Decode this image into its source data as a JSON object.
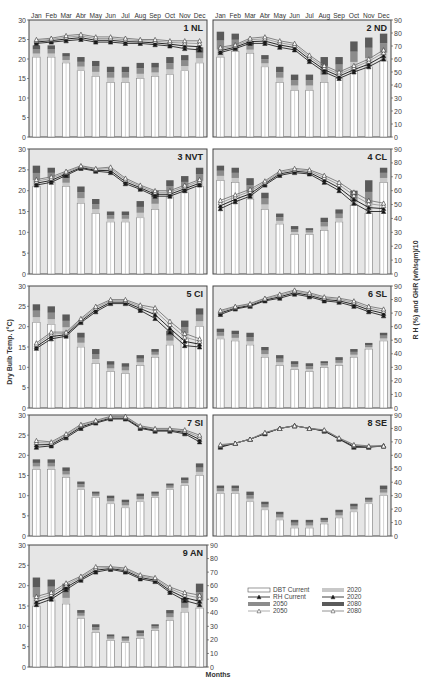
{
  "chart_data": {
    "type": "bar",
    "title": "",
    "xlabel": "Months",
    "ylabel": "Dry Bulb Temp. (°C)",
    "ylabel_right": "R H (%) and GHR (wh/sqm)/10",
    "ylim": [
      0,
      30
    ],
    "ylim_right": [
      0,
      90
    ],
    "left_ticks": [
      "0",
      "5",
      "10",
      "15",
      "20",
      "25",
      "30"
    ],
    "right_ticks": [
      "0",
      "10",
      "20",
      "30",
      "40",
      "50",
      "60",
      "70",
      "80",
      "90"
    ],
    "categories": [
      "Jan",
      "Feb",
      "Mar",
      "Abr",
      "May",
      "Jun",
      "Jul",
      "Aug",
      "Sep",
      "Oct",
      "Nov",
      "Dec"
    ],
    "legend": [
      {
        "key": "dbt_current",
        "label": "DBT Current"
      },
      {
        "key": "rh_current",
        "label": "RH Current"
      },
      {
        "key": "dbt_2050",
        "label": "2050"
      },
      {
        "key": "rh_2050",
        "label": "2050"
      },
      {
        "key": "dbt_2020",
        "label": "2020"
      },
      {
        "key": "rh_2020",
        "label": "2020"
      },
      {
        "key": "dbt_2080",
        "label": "2080"
      },
      {
        "key": "rh_2080",
        "label": "2080"
      }
    ],
    "grid": false,
    "legend_position": "bottom-right",
    "panels": [
      {
        "id": "1 NL",
        "label": "1 NL",
        "dbt_current": [
          20.5,
          20.5,
          19,
          17,
          15.5,
          14,
          14,
          15,
          15.5,
          16,
          17,
          19
        ],
        "dbt_2080": [
          23.5,
          23.5,
          21.5,
          20.5,
          19.5,
          18,
          18,
          19,
          19,
          20.5,
          21,
          23
        ],
        "rh_current": [
          72,
          73,
          74,
          75,
          73,
          73,
          72,
          72,
          71,
          70,
          68,
          67
        ],
        "rh_2080": [
          75,
          76,
          78,
          79,
          77,
          77,
          76,
          75,
          75,
          74,
          74,
          74
        ]
      },
      {
        "id": "2 ND",
        "label": "2 ND",
        "dbt_current": [
          20.5,
          22,
          21.5,
          18,
          14,
          12,
          12,
          14,
          15,
          17,
          18,
          19.5
        ],
        "dbt_2080": [
          27,
          26.5,
          24.5,
          21,
          18,
          16,
          16,
          20.5,
          20.5,
          24.5,
          25.5,
          26.5
        ],
        "rh_current": [
          65,
          68,
          72,
          72,
          69,
          67,
          58,
          50,
          45,
          50,
          54,
          60
        ],
        "rh_2080": [
          69,
          71,
          76,
          77,
          74,
          72,
          63,
          55,
          50,
          55,
          60,
          67
        ]
      },
      {
        "id": "3 NVT",
        "label": "3 NVT",
        "dbt_current": [
          21,
          22,
          21,
          17,
          14.5,
          12.5,
          12.5,
          13.5,
          15.5,
          18.5,
          19.5,
          21
        ],
        "dbt_2080": [
          26,
          25.5,
          24,
          21,
          18,
          15,
          15,
          17.5,
          20,
          22.5,
          23.5,
          25.5
        ],
        "rh_current": [
          64,
          66,
          71,
          76,
          74,
          73,
          65,
          61,
          56,
          56,
          60,
          64
        ],
        "rh_2080": [
          68,
          70,
          74,
          78,
          76,
          77,
          69,
          64,
          60,
          60,
          64,
          68
        ]
      },
      {
        "id": "4 CL",
        "label": "4 CL",
        "dbt_current": [
          22.5,
          22,
          18,
          15.5,
          12,
          9.5,
          9.5,
          10.5,
          12.5,
          16.5,
          14.5,
          22
        ],
        "dbt_2080": [
          26,
          25.5,
          23,
          19.5,
          14.5,
          11.5,
          11,
          13.5,
          15.5,
          20,
          22.5,
          25.5
        ],
        "rh_current": [
          47,
          52,
          56,
          64,
          71,
          73,
          72,
          66,
          60,
          51,
          45,
          45
        ],
        "rh_2080": [
          53,
          57,
          61,
          67,
          74,
          76,
          75,
          71,
          66,
          59,
          53,
          51
        ]
      },
      {
        "id": "5 CI",
        "label": "5 CI",
        "dbt_current": [
          21,
          20.5,
          18.5,
          15,
          11,
          9,
          8.5,
          10.5,
          12.5,
          15.5,
          17,
          20
        ],
        "dbt_2080": [
          25.5,
          25,
          23,
          18.5,
          14.5,
          11.5,
          11,
          13,
          14.5,
          19,
          21.5,
          24.5
        ],
        "rh_current": [
          44,
          51,
          53,
          63,
          71,
          77,
          77,
          72,
          66,
          56,
          46,
          45
        ],
        "rh_2080": [
          48,
          56,
          56,
          66,
          75,
          80,
          80,
          76,
          74,
          64,
          55,
          51
        ]
      },
      {
        "id": "6 SL",
        "label": "6 SL",
        "dbt_current": [
          17,
          16.5,
          15.5,
          12.5,
          10.5,
          9.5,
          9,
          10,
          10.5,
          12.5,
          14.5,
          16.5
        ],
        "dbt_2080": [
          19.5,
          19,
          18.5,
          15,
          13,
          11.5,
          11,
          11.5,
          12.5,
          14.5,
          16,
          18.5
        ],
        "rh_current": [
          69,
          73,
          75,
          79,
          81,
          84,
          82,
          79,
          78,
          75,
          71,
          68
        ],
        "rh_2080": [
          72,
          75,
          77,
          81,
          84,
          87,
          85,
          82,
          81,
          79,
          75,
          73
        ]
      },
      {
        "id": "7 SI",
        "label": "7 SI",
        "dbt_current": [
          16.5,
          16.5,
          14.5,
          11.5,
          9.5,
          8,
          7,
          8.5,
          9.5,
          11.5,
          12.5,
          15
        ],
        "dbt_2080": [
          19,
          19,
          17,
          13.5,
          11,
          10,
          9,
          10.5,
          11,
          13,
          14.5,
          18
        ],
        "rh_current": [
          66,
          67,
          73,
          80,
          84,
          87,
          87,
          80,
          78,
          78,
          76,
          70
        ],
        "rh_2080": [
          71,
          70,
          76,
          83,
          86,
          89,
          89,
          82,
          80,
          80,
          79,
          75
        ]
      },
      {
        "id": "8 SE",
        "label": "8 SE",
        "dbt_current": [
          10.5,
          10.5,
          8.5,
          6.5,
          4,
          2,
          2,
          3,
          4.5,
          6,
          8,
          10
        ],
        "dbt_2080": [
          12.5,
          12.5,
          11,
          8.5,
          6,
          4,
          4,
          4.5,
          6.5,
          8,
          9.5,
          12.5
        ],
        "rh_current": [
          66,
          69,
          72,
          76,
          80,
          82,
          80,
          78,
          72,
          66,
          66,
          67
        ],
        "rh_2080": [
          68,
          69,
          72,
          77,
          80,
          82,
          80,
          79,
          73,
          68,
          67,
          67
        ]
      },
      {
        "id": "9 AN",
        "label": "9 AN",
        "dbt_current": [
          15,
          16.5,
          15.5,
          12,
          8.5,
          6.5,
          6,
          7,
          9,
          11.5,
          13.5,
          14.5
        ],
        "dbt_2080": [
          22,
          21.5,
          20.5,
          14,
          10.5,
          8,
          7.5,
          9,
          10.5,
          14,
          17,
          20.5
        ],
        "rh_current": [
          46,
          50,
          57,
          64,
          70,
          72,
          70,
          65,
          63,
          55,
          49,
          46
        ],
        "rh_2080": [
          52,
          55,
          62,
          67,
          74,
          74,
          73,
          68,
          66,
          59,
          55,
          53
        ]
      }
    ]
  },
  "figure": {
    "xlabel": "Months",
    "ylabel_left": "Dry Bulb Temp. (°C)",
    "ylabel_right": "R H (%) and GHR (wh/sqm)/10",
    "colors": {
      "panel_bg": "#e6e6e6",
      "frame": "#444444",
      "bar_current": "#ffffff",
      "bar_2020": "#c8c8c8",
      "bar_2050": "#8c8c8c",
      "bar_2080": "#5a5a5a",
      "rh_current": "#222222",
      "rh_2020": "#111111",
      "rh_2050": "#999999",
      "rh_2080": "#777777"
    }
  }
}
